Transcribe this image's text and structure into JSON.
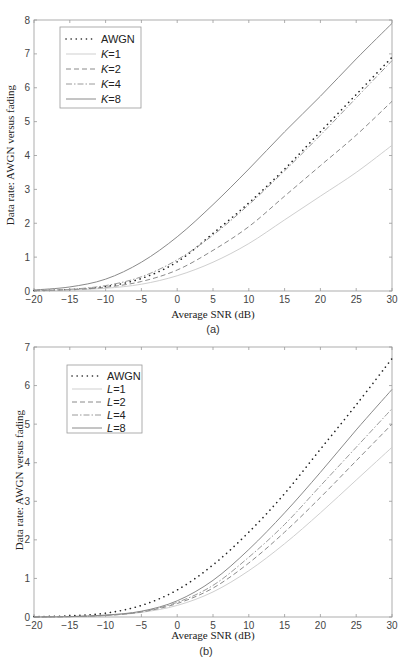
{
  "chart_data": [
    {
      "type": "line",
      "panel": "(a)",
      "title": "",
      "xlabel": "Average SNR (dB)",
      "ylabel": "Data rate: AWGN versus fading",
      "xlim": [
        -20,
        30
      ],
      "ylim": [
        0,
        8
      ],
      "xticks": [
        -20,
        -15,
        -10,
        -5,
        0,
        5,
        10,
        15,
        20,
        25,
        30
      ],
      "yticks": [
        0,
        1,
        2,
        3,
        4,
        5,
        6,
        7,
        8
      ],
      "grid": false,
      "legend_position": "upper left",
      "x": [
        -20,
        -15,
        -10,
        -5,
        0,
        5,
        10,
        15,
        20,
        25,
        30
      ],
      "series": [
        {
          "name": "AWGN",
          "style": "dotted",
          "color": "#222222",
          "values": [
            0.01,
            0.04,
            0.13,
            0.37,
            0.86,
            1.7,
            2.6,
            3.6,
            4.7,
            5.8,
            6.9
          ]
        },
        {
          "name": "K=1",
          "style": "solid-light",
          "color": "#c8c8c8",
          "values": [
            0.01,
            0.03,
            0.08,
            0.2,
            0.45,
            0.85,
            1.4,
            2.1,
            2.8,
            3.5,
            4.3
          ]
        },
        {
          "name": "K=2",
          "style": "dashed",
          "color": "#888888",
          "values": [
            0.01,
            0.04,
            0.11,
            0.28,
            0.62,
            1.2,
            1.9,
            2.8,
            3.7,
            4.6,
            5.6
          ]
        },
        {
          "name": "K=4",
          "style": "dashdot",
          "color": "#999999",
          "values": [
            0.01,
            0.05,
            0.16,
            0.42,
            0.92,
            1.65,
            2.55,
            3.55,
            4.6,
            5.7,
            6.8
          ]
        },
        {
          "name": "K=8",
          "style": "solid",
          "color": "#888888",
          "values": [
            0.03,
            0.12,
            0.35,
            0.85,
            1.6,
            2.55,
            3.6,
            4.7,
            5.75,
            6.85,
            7.9
          ]
        }
      ]
    },
    {
      "type": "line",
      "panel": "(b)",
      "title": "",
      "xlabel": "Average SNR (dB)",
      "ylabel": "Data rate: AWGN versus fading",
      "xlim": [
        -20,
        30
      ],
      "ylim": [
        0,
        7
      ],
      "xticks": [
        -20,
        -15,
        -10,
        -5,
        0,
        5,
        10,
        15,
        20,
        25,
        30
      ],
      "yticks": [
        0,
        1,
        2,
        3,
        4,
        5,
        6,
        7
      ],
      "grid": false,
      "legend_position": "upper left",
      "x": [
        -20,
        -15,
        -10,
        -5,
        0,
        5,
        10,
        15,
        20,
        25,
        30
      ],
      "series": [
        {
          "name": "AWGN",
          "style": "dotted",
          "color": "#222222",
          "values": [
            0.01,
            0.03,
            0.1,
            0.3,
            0.7,
            1.35,
            2.2,
            3.2,
            4.35,
            5.5,
            6.7
          ]
        },
        {
          "name": "L=1",
          "style": "solid-light",
          "color": "#c8c8c8",
          "values": [
            0.0,
            0.01,
            0.04,
            0.12,
            0.3,
            0.65,
            1.2,
            1.9,
            2.7,
            3.55,
            4.4
          ]
        },
        {
          "name": "L=2",
          "style": "dashed",
          "color": "#888888",
          "values": [
            0.0,
            0.01,
            0.04,
            0.13,
            0.35,
            0.75,
            1.4,
            2.2,
            3.1,
            4.05,
            5.0
          ]
        },
        {
          "name": "L=4",
          "style": "dashdot",
          "color": "#999999",
          "values": [
            0.0,
            0.01,
            0.04,
            0.14,
            0.38,
            0.82,
            1.55,
            2.4,
            3.4,
            4.4,
            5.4
          ]
        },
        {
          "name": "L=8",
          "style": "solid",
          "color": "#888888",
          "values": [
            0.0,
            0.01,
            0.05,
            0.15,
            0.42,
            0.95,
            1.75,
            2.7,
            3.75,
            4.85,
            5.9
          ]
        }
      ]
    }
  ],
  "panels": {
    "a": {
      "caption": "(a)",
      "xlabel": "Average SNR (dB)",
      "ylabel": "Data rate: AWGN versus fading",
      "xticks": [
        "−20",
        "−15",
        "−10",
        "−5",
        "0",
        "5",
        "10",
        "15",
        "20",
        "25",
        "30"
      ],
      "yticks": [
        "0",
        "1",
        "2",
        "3",
        "4",
        "5",
        "6",
        "7",
        "8"
      ],
      "legend": [
        {
          "prefix": "",
          "label": "AWGN"
        },
        {
          "prefix": "K",
          "label": "=1"
        },
        {
          "prefix": "K",
          "label": "=2"
        },
        {
          "prefix": "K",
          "label": "=4"
        },
        {
          "prefix": "K",
          "label": "=8"
        }
      ]
    },
    "b": {
      "caption": "(b)",
      "xlabel": "Average SNR (dB)",
      "ylabel": "Data rate: AWGN versus fading",
      "xticks": [
        "−20",
        "−15",
        "−10",
        "−5",
        "0",
        "5",
        "10",
        "15",
        "20",
        "25",
        "30"
      ],
      "yticks": [
        "0",
        "1",
        "2",
        "3",
        "4",
        "5",
        "6",
        "7"
      ],
      "legend": [
        {
          "prefix": "",
          "label": "AWGN"
        },
        {
          "prefix": "L",
          "label": "=1"
        },
        {
          "prefix": "L",
          "label": "=2"
        },
        {
          "prefix": "L",
          "label": "=4"
        },
        {
          "prefix": "L",
          "label": "=8"
        }
      ]
    }
  }
}
